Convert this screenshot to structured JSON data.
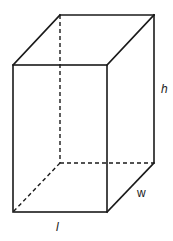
{
  "diagram": {
    "type": "rectangular-prism",
    "labels": {
      "length": "l",
      "width": "w",
      "height": "h"
    },
    "colors": {
      "stroke": "#1a1a1a",
      "background": "#ffffff"
    },
    "vertices": {
      "front_top_left": [
        13,
        65
      ],
      "front_top_right": [
        107,
        65
      ],
      "front_bottom_left": [
        13,
        212
      ],
      "front_bottom_right": [
        107,
        212
      ],
      "back_top_left": [
        60,
        15
      ],
      "back_top_right": [
        154,
        15
      ],
      "back_bottom_left": [
        60,
        163
      ],
      "back_bottom_right": [
        154,
        163
      ]
    },
    "hidden_edges": [
      "back_top_left-back_bottom_left",
      "back_bottom_left-back_bottom_right",
      "back_bottom_left-front_bottom_left"
    ]
  }
}
